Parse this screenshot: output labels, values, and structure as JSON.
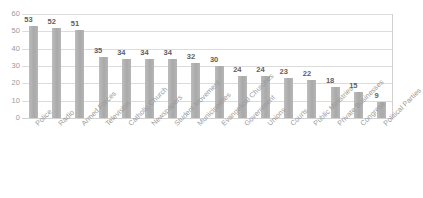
{
  "chart_data": {
    "type": "bar",
    "title": "",
    "subtitle": "",
    "xlabel": "",
    "ylabel": "",
    "ylim": [
      0,
      60
    ],
    "yticks": [
      0,
      10,
      20,
      30,
      40,
      50,
      60
    ],
    "ytick_labels": [
      "0",
      "10",
      "20",
      "30",
      "40",
      "50",
      "60"
    ],
    "grid": true,
    "legend": false,
    "legend_position": "none",
    "orientation": "vertical",
    "bar_color": "#b2b2b2",
    "gridline_color": "#dcdcdc",
    "axis_color": "#d2d2d2",
    "label_color": "#9a9a9a",
    "data_label_color": "#5e5e5e",
    "data_labels_shown": true,
    "categories": [
      "Police",
      "Radio",
      "Armed Forces",
      "Television",
      "Catholic Church",
      "Newspapers",
      "Student Movement",
      "Municipalities",
      "Evangelical Churches",
      "Government",
      "Unions",
      "Courts",
      "Public Ministries",
      "Private Businesses",
      "Congress",
      "Political Parties"
    ],
    "values": [
      53,
      52,
      51,
      35,
      34,
      34,
      34,
      32,
      30,
      24,
      24,
      23,
      22,
      18,
      15,
      9
    ],
    "value_labels": [
      "53",
      "52",
      "51",
      "35",
      "34",
      "34",
      "34",
      "32",
      "30",
      "24",
      "24",
      "23",
      "22",
      "18",
      "15",
      "9"
    ]
  }
}
